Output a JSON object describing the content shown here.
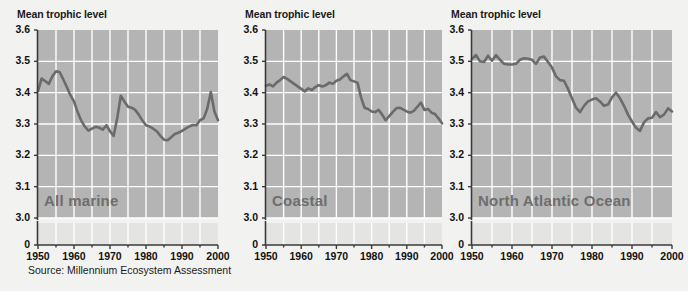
{
  "figure": {
    "source_note": "Source: Millennium Ecosystem Assessment",
    "axis_title": "Mean trophic level",
    "background_color": "#f2f2f0",
    "plot_background_color": "#b4b4b4",
    "break_band_color": "#e4e4e2",
    "gridline_color": "#ffffff",
    "line_color": "#6b6b6b",
    "axis_color": "#3a3a3a",
    "label_color": "#6e6e6e"
  },
  "chart_data": [
    {
      "type": "line",
      "title": "All marine",
      "ylabel": "Mean trophic level",
      "xlabel": "",
      "xlim": [
        1950,
        2000
      ],
      "ylim": [
        3.0,
        3.6
      ],
      "yticks": [
        3.0,
        3.1,
        3.2,
        3.3,
        3.4,
        3.5,
        3.6
      ],
      "ytick_labels": [
        "3.0",
        "3.1",
        "3.2",
        "3.3",
        "3.4",
        "3.5",
        "3.6"
      ],
      "axis_break": true,
      "break_tick": "0",
      "xticks": [
        1950,
        1960,
        1970,
        1980,
        1990,
        2000
      ],
      "xtick_labels": [
        "1950",
        "1960",
        "1970",
        "1980",
        "1990",
        "2000"
      ],
      "grid": true,
      "legend": "none",
      "x": [
        1950,
        1951,
        1952,
        1953,
        1954,
        1955,
        1956,
        1957,
        1958,
        1959,
        1960,
        1961,
        1962,
        1963,
        1964,
        1965,
        1966,
        1967,
        1968,
        1969,
        1970,
        1971,
        1972,
        1973,
        1974,
        1975,
        1976,
        1977,
        1978,
        1979,
        1980,
        1981,
        1982,
        1983,
        1984,
        1985,
        1986,
        1987,
        1988,
        1989,
        1990,
        1991,
        1992,
        1993,
        1994,
        1995,
        1996,
        1997,
        1998,
        1999,
        2000
      ],
      "values": [
        3.405,
        3.445,
        3.437,
        3.428,
        3.452,
        3.468,
        3.466,
        3.443,
        3.418,
        3.392,
        3.372,
        3.338,
        3.311,
        3.292,
        3.279,
        3.285,
        3.291,
        3.288,
        3.282,
        3.296,
        3.277,
        3.262,
        3.318,
        3.39,
        3.372,
        3.355,
        3.352,
        3.345,
        3.33,
        3.311,
        3.296,
        3.292,
        3.285,
        3.277,
        3.262,
        3.25,
        3.248,
        3.258,
        3.268,
        3.272,
        3.278,
        3.285,
        3.292,
        3.297,
        3.296,
        3.312,
        3.318,
        3.348,
        3.402,
        3.34,
        3.312
      ]
    },
    {
      "type": "line",
      "title": "Coastal",
      "ylabel": "Mean trophic level",
      "xlabel": "",
      "xlim": [
        1950,
        2000
      ],
      "ylim": [
        3.0,
        3.6
      ],
      "yticks": [
        3.0,
        3.1,
        3.2,
        3.3,
        3.4,
        3.5,
        3.6
      ],
      "ytick_labels": [
        "3.0",
        "3.1",
        "3.2",
        "3.3",
        "3.4",
        "3.5",
        "3.6"
      ],
      "axis_break": true,
      "break_tick": "0",
      "xticks": [
        1950,
        1960,
        1970,
        1980,
        1990,
        2000
      ],
      "xtick_labels": [
        "1950",
        "1960",
        "1970",
        "1980",
        "1990",
        "2000"
      ],
      "grid": true,
      "legend": "none",
      "x": [
        1950,
        1951,
        1952,
        1953,
        1954,
        1955,
        1956,
        1957,
        1958,
        1959,
        1960,
        1961,
        1962,
        1963,
        1964,
        1965,
        1966,
        1967,
        1968,
        1969,
        1970,
        1971,
        1972,
        1973,
        1974,
        1975,
        1976,
        1977,
        1978,
        1979,
        1980,
        1981,
        1982,
        1983,
        1984,
        1985,
        1986,
        1987,
        1988,
        1989,
        1990,
        1991,
        1992,
        1993,
        1994,
        1995,
        1996,
        1997,
        1998,
        1999,
        2000
      ],
      "values": [
        3.422,
        3.426,
        3.42,
        3.432,
        3.44,
        3.45,
        3.444,
        3.436,
        3.428,
        3.42,
        3.412,
        3.404,
        3.414,
        3.408,
        3.418,
        3.424,
        3.42,
        3.424,
        3.432,
        3.428,
        3.438,
        3.442,
        3.452,
        3.46,
        3.44,
        3.436,
        3.432,
        3.385,
        3.352,
        3.348,
        3.34,
        3.338,
        3.345,
        3.33,
        3.312,
        3.325,
        3.338,
        3.35,
        3.352,
        3.346,
        3.34,
        3.336,
        3.342,
        3.355,
        3.368,
        3.345,
        3.348,
        3.336,
        3.332,
        3.318,
        3.302
      ]
    },
    {
      "type": "line",
      "title": "North Atlantic Ocean",
      "ylabel": "Mean trophic level",
      "xlabel": "",
      "xlim": [
        1950,
        2000
      ],
      "ylim": [
        3.0,
        3.6
      ],
      "yticks": [
        3.0,
        3.1,
        3.2,
        3.3,
        3.4,
        3.5,
        3.6
      ],
      "ytick_labels": [
        "3.0",
        "3.1",
        "3.2",
        "3.3",
        "3.4",
        "3.5",
        "3.6"
      ],
      "axis_break": true,
      "break_tick": "0",
      "xticks": [
        1950,
        1960,
        1970,
        1980,
        1990,
        2000
      ],
      "xtick_labels": [
        "1950",
        "1960",
        "1970",
        "1980",
        "1990",
        "2000"
      ],
      "grid": true,
      "legend": "none",
      "x": [
        1950,
        1951,
        1952,
        1953,
        1954,
        1955,
        1956,
        1957,
        1958,
        1959,
        1960,
        1961,
        1962,
        1963,
        1964,
        1965,
        1966,
        1967,
        1968,
        1969,
        1970,
        1971,
        1972,
        1973,
        1974,
        1975,
        1976,
        1977,
        1978,
        1979,
        1980,
        1981,
        1982,
        1983,
        1984,
        1985,
        1986,
        1987,
        1988,
        1989,
        1990,
        1991,
        1992,
        1993,
        1994,
        1995,
        1996,
        1997,
        1998,
        1999,
        2000
      ],
      "values": [
        3.508,
        3.52,
        3.5,
        3.498,
        3.518,
        3.502,
        3.52,
        3.505,
        3.492,
        3.49,
        3.49,
        3.492,
        3.505,
        3.51,
        3.508,
        3.505,
        3.492,
        3.512,
        3.515,
        3.498,
        3.48,
        3.452,
        3.44,
        3.438,
        3.412,
        3.382,
        3.352,
        3.338,
        3.358,
        3.372,
        3.378,
        3.382,
        3.372,
        3.358,
        3.362,
        3.385,
        3.4,
        3.382,
        3.358,
        3.33,
        3.308,
        3.288,
        3.278,
        3.305,
        3.318,
        3.32,
        3.338,
        3.322,
        3.33,
        3.35,
        3.34
      ]
    }
  ]
}
